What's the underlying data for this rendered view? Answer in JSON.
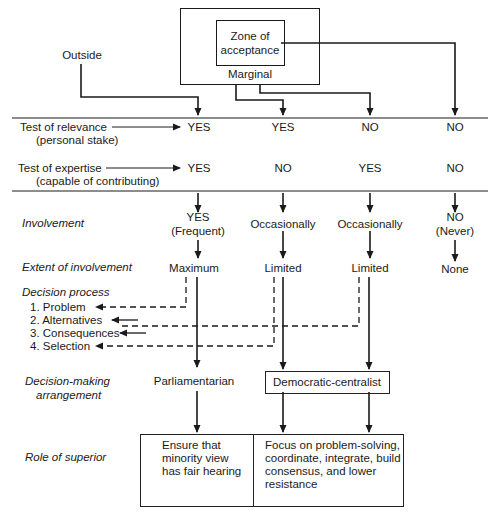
{
  "source_box": {
    "outer_label": "Marginal",
    "inner_label_line1": "Zone of",
    "inner_label_line2": "acceptance",
    "outside_label": "Outside"
  },
  "tests": {
    "relevance": {
      "label": "Test of relevance",
      "sub": "(personal stake)",
      "values": [
        "YES",
        "YES",
        "NO",
        "NO"
      ]
    },
    "expertise": {
      "label": "Test of expertise",
      "sub": "(capable of contributing)",
      "values": [
        "YES",
        "NO",
        "YES",
        "NO"
      ]
    }
  },
  "rows": {
    "involvement": {
      "label": "Involvement",
      "values": [
        {
          "main": "YES",
          "sub": "(Frequent)"
        },
        {
          "main": "Occasionally",
          "sub": ""
        },
        {
          "main": "Occasionally",
          "sub": ""
        },
        {
          "main": "NO",
          "sub": "(Never)"
        }
      ]
    },
    "extent": {
      "label": "Extent of involvement",
      "values": [
        "Maximum",
        "Limited",
        "Limited",
        "None"
      ]
    },
    "decision_process": {
      "label": "Decision process",
      "steps": [
        "1.  Problem",
        "2.  Alternatives",
        "3.  Consequences",
        "4.  Selection"
      ]
    },
    "arrangement": {
      "label_line1": "Decision-making",
      "label_line2": "arrangement",
      "parliamentarian": "Parliamentarian",
      "democratic_centralist": "Democratic-centralist"
    },
    "role": {
      "label": "Role of superior",
      "left_text": "Ensure that minority view has fair hearing",
      "right_text": "Focus on problem-solving, coordinate, integrate, build consensus, and lower resistance"
    }
  },
  "colors": {
    "ink": "#1a1a1a",
    "background": "#ffffff"
  }
}
